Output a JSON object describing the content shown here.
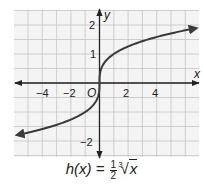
{
  "chart_data": {
    "type": "line",
    "title": "",
    "caption": "h(x) = 1/2 ∛x",
    "xlabel": "x",
    "ylabel": "y",
    "origin_label": "O",
    "xlim": [
      -6,
      6.9
    ],
    "ylim": [
      -2.55,
      2.5
    ],
    "x_ticks": [
      -4,
      -2,
      2,
      4
    ],
    "y_ticks": [
      -2,
      1,
      2
    ],
    "grid": true,
    "grid_x_step": 1,
    "grid_y_step": 0.5,
    "series": [
      {
        "name": "h(x)",
        "function": "h(x) = 1/2 ∛x",
        "x": [
          -5.8,
          -4,
          -2,
          -1,
          -0.5,
          -0.1,
          0,
          0.1,
          0.5,
          1,
          2,
          4,
          6.8
        ],
        "y": [
          -1.8,
          -1.59,
          -1.26,
          -1.0,
          -0.79,
          -0.46,
          0,
          0.46,
          0.79,
          1.0,
          1.26,
          1.59,
          1.89
        ],
        "color": "#3a3a3a",
        "arrows": "both"
      }
    ]
  },
  "caption": {
    "func": "h(x) = ",
    "num": "1",
    "den": "2",
    "index": "3",
    "radicand": "x"
  },
  "labels": {
    "x_axis": "x",
    "y_axis": "y",
    "origin": "O",
    "xt_m4": "−4",
    "xt_m2": "−2",
    "xt_2": "2",
    "xt_4": "4",
    "yt_2": "2",
    "yt_1": "1",
    "yt_m2": "−2"
  },
  "colors": {
    "grid": "#bfbfbf",
    "grid_bg": "#f2f2f2",
    "axis": "#222222",
    "curve": "#3a3a3a"
  }
}
